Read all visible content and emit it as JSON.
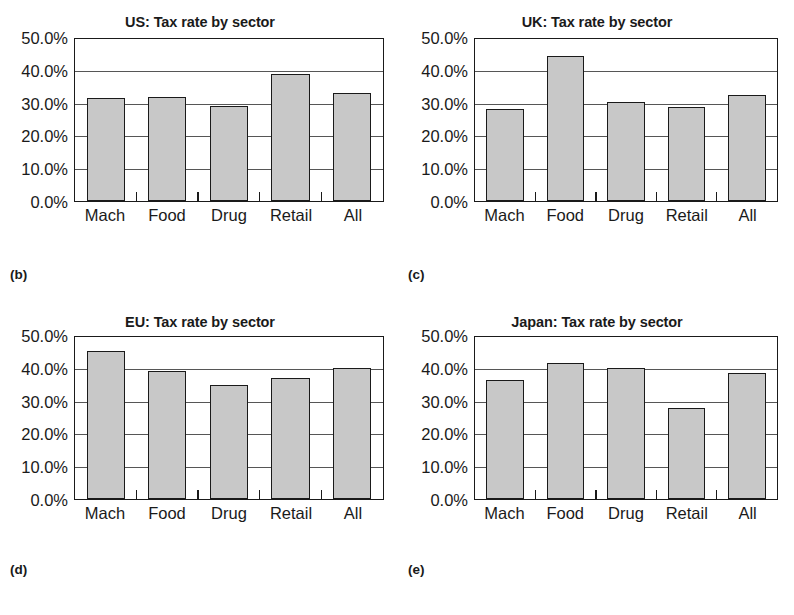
{
  "figure": {
    "y_ticks": [
      "0.0%",
      "10.0%",
      "20.0%",
      "30.0%",
      "40.0%",
      "50.0%"
    ],
    "categories": [
      "Mach",
      "Food",
      "Drug",
      "Retail",
      "All"
    ],
    "bar_fill_color": "#c8c8c8",
    "bar_border_color": "#1a1a1a",
    "panels": [
      {
        "label": "(b)",
        "title": "US: Tax rate by sector",
        "values": [
          31.8,
          32.0,
          29.2,
          39.2,
          33.2
        ]
      },
      {
        "label": "(c)",
        "title": "UK: Tax rate by sector",
        "values": [
          28.4,
          44.8,
          30.5,
          29.0,
          32.6
        ]
      },
      {
        "label": "(d)",
        "title": "EU: Tax rate by sector",
        "values": [
          45.8,
          39.4,
          35.2,
          37.4,
          40.3
        ]
      },
      {
        "label": "(e)",
        "title": "Japan: Tax rate by sector",
        "values": [
          36.6,
          42.0,
          40.4,
          28.2,
          39.0
        ]
      }
    ]
  },
  "chart_data": [
    {
      "type": "bar",
      "title": "US: Tax rate by sector",
      "panel_label": "(b)",
      "categories": [
        "Mach",
        "Food",
        "Drug",
        "Retail",
        "All"
      ],
      "values": [
        31.8,
        32.0,
        29.2,
        39.2,
        33.2
      ],
      "xlabel": "",
      "ylabel": "",
      "ylim": [
        0,
        50
      ],
      "ytick_labels": [
        "0.0%",
        "10.0%",
        "20.0%",
        "30.0%",
        "40.0%",
        "50.0%"
      ],
      "ytick_values": [
        0,
        10,
        20,
        30,
        40,
        50
      ],
      "units": "percent",
      "grid": "horizontal",
      "legend": "none"
    },
    {
      "type": "bar",
      "title": "UK: Tax rate by sector",
      "panel_label": "(c)",
      "categories": [
        "Mach",
        "Food",
        "Drug",
        "Retail",
        "All"
      ],
      "values": [
        28.4,
        44.8,
        30.5,
        29.0,
        32.6
      ],
      "xlabel": "",
      "ylabel": "",
      "ylim": [
        0,
        50
      ],
      "ytick_labels": [
        "0.0%",
        "10.0%",
        "20.0%",
        "30.0%",
        "40.0%",
        "50.0%"
      ],
      "ytick_values": [
        0,
        10,
        20,
        30,
        40,
        50
      ],
      "units": "percent",
      "grid": "horizontal",
      "legend": "none"
    },
    {
      "type": "bar",
      "title": "EU: Tax rate by sector",
      "panel_label": "(d)",
      "categories": [
        "Mach",
        "Food",
        "Drug",
        "Retail",
        "All"
      ],
      "values": [
        45.8,
        39.4,
        35.2,
        37.4,
        40.3
      ],
      "xlabel": "",
      "ylabel": "",
      "ylim": [
        0,
        50
      ],
      "ytick_labels": [
        "0.0%",
        "10.0%",
        "20.0%",
        "30.0%",
        "40.0%",
        "50.0%"
      ],
      "ytick_values": [
        0,
        10,
        20,
        30,
        40,
        50
      ],
      "units": "percent",
      "grid": "horizontal",
      "legend": "none"
    },
    {
      "type": "bar",
      "title": "Japan: Tax rate by sector",
      "panel_label": "(e)",
      "categories": [
        "Mach",
        "Food",
        "Drug",
        "Retail",
        "All"
      ],
      "values": [
        36.6,
        42.0,
        40.4,
        28.2,
        39.0
      ],
      "xlabel": "",
      "ylabel": "",
      "ylim": [
        0,
        50
      ],
      "ytick_labels": [
        "0.0%",
        "10.0%",
        "20.0%",
        "30.0%",
        "40.0%",
        "50.0%"
      ],
      "ytick_values": [
        0,
        10,
        20,
        30,
        40,
        50
      ],
      "units": "percent",
      "grid": "horizontal",
      "legend": "none"
    }
  ]
}
